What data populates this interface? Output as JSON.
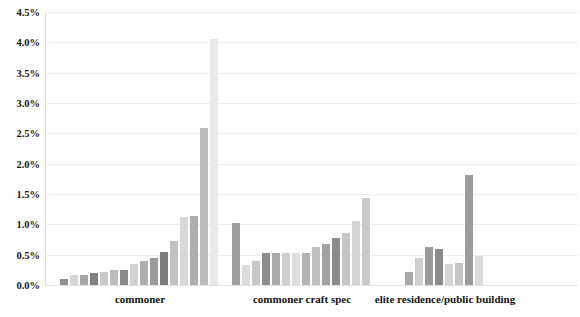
{
  "chart_data": {
    "type": "bar",
    "title": "",
    "xlabel": "",
    "ylabel": "",
    "ylim": [
      0,
      4.5
    ],
    "ytick_labels": [
      "0.0%",
      "0.5%",
      "1.0%",
      "1.5%",
      "2.0%",
      "2.5%",
      "3.0%",
      "3.5%",
      "4.0%",
      "4.5%"
    ],
    "ytick_values": [
      0,
      0.5,
      1.0,
      1.5,
      2.0,
      2.5,
      3.0,
      3.5,
      4.0,
      4.5
    ],
    "grid": true,
    "legend": "none",
    "value_suffix": "%",
    "categories": [
      "commoner",
      "commoner craft spec",
      "elite residence/public building"
    ],
    "groups": [
      {
        "category": "commoner",
        "values": [
          0.1,
          0.16,
          0.17,
          0.2,
          0.21,
          0.25,
          0.25,
          0.35,
          0.4,
          0.44,
          0.55,
          0.73,
          1.12,
          1.13,
          2.58,
          4.05
        ],
        "colors": [
          "#8f8f8f",
          "#d6d6d6",
          "#a6a6a6",
          "#7f7f7f",
          "#c9c9c9",
          "#bdbdbd",
          "#8a8a8a",
          "#d2d2d2",
          "#b0b0b0",
          "#9a9a9a",
          "#7c7c7c",
          "#c2c2c2",
          "#d8d8d8",
          "#aeaeae",
          "#bcbcbc",
          "#e8e8e8"
        ]
      },
      {
        "category": "commoner craft spec",
        "values": [
          1.03,
          0.33,
          0.4,
          0.52,
          0.52,
          0.53,
          0.52,
          0.53,
          0.62,
          0.68,
          0.78,
          0.86,
          1.05,
          1.44
        ],
        "colors": [
          "#9d9d9d",
          "#dcdcdc",
          "#c8c8c8",
          "#8d8d8d",
          "#a9a9a9",
          "#cfcfcf",
          "#dedede",
          "#b4b4b4",
          "#c0c0c0",
          "#a2a2a2",
          "#8c8c8c",
          "#c6c6c6",
          "#d4d4d4",
          "#cacaca"
        ]
      },
      {
        "category": "elite residence/public building",
        "values": [
          0.21,
          0.44,
          0.62,
          0.6,
          0.35,
          0.37,
          1.81,
          0.48
        ],
        "colors": [
          "#a8a8a8",
          "#cfcfcf",
          "#9a9a9a",
          "#8b8b8b",
          "#d5d5d5",
          "#c4c4c4",
          "#9b9b9b",
          "#dadada"
        ]
      }
    ]
  },
  "layout": {
    "plot_left": 45,
    "plot_top": 12,
    "plot_width": 533,
    "plot_height": 273,
    "bar_width": 8,
    "bar_gap": 2,
    "group_starts": [
      60,
      232,
      405
    ]
  }
}
